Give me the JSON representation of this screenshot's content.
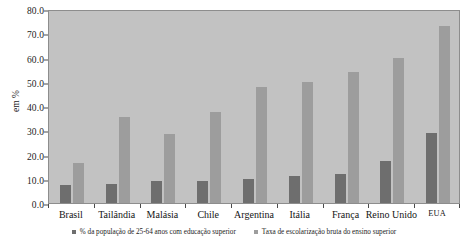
{
  "chart_data": {
    "type": "bar",
    "title": "",
    "xlabel": "",
    "ylabel": "em %",
    "ylim": [
      0,
      80
    ],
    "ytick_step": 10,
    "ytick_labels": [
      "0.0",
      "10.0",
      "20.0",
      "30.0",
      "40.0",
      "50.0",
      "60.0",
      "70.0",
      "80.0"
    ],
    "grid": false,
    "legend_position": "bottom",
    "categories": [
      "Brasil",
      "Tailândia",
      "Malásia",
      "Chile",
      "Argentina",
      "Itália",
      "França",
      "Reino Unido",
      "EUA"
    ],
    "series": [
      {
        "name": "% da população de 25-64 anos com educação superior",
        "color": "#6e6e6e",
        "values": [
          7.5,
          8.0,
          9.0,
          9.0,
          10.0,
          11.0,
          12.0,
          17.5,
          29.0
        ]
      },
      {
        "name": "Taxa de escolarização bruta do ensino superior",
        "color": "#9d9d9d",
        "values": [
          16.5,
          35.5,
          28.5,
          37.5,
          48.0,
          50.0,
          54.0,
          60.0,
          73.0
        ]
      }
    ],
    "plot_background": "#c2c2c2",
    "page_background": "#ffffff"
  },
  "axis": {
    "y_title": "em %"
  },
  "legend": {
    "items": [
      {
        "label": "% da população de 25-64 anos com educação superior"
      },
      {
        "label": "Taxa de escolarização bruta do ensino superior"
      }
    ]
  }
}
